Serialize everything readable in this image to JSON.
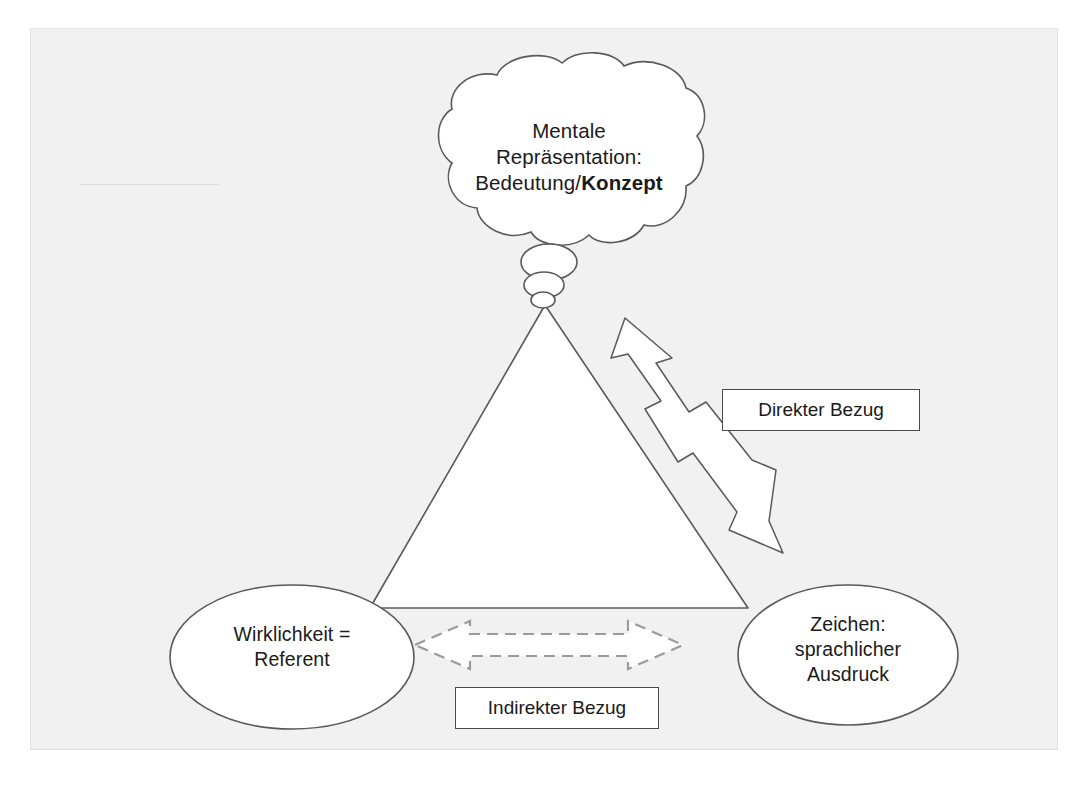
{
  "diagram": {
    "nodes": {
      "cloud": {
        "shape": "thought-cloud",
        "line1": "Mentale",
        "line2": "Repräsentation:",
        "line3_prefix": "Bedeutung/",
        "line3_bold": "Konzept"
      },
      "referent": {
        "shape": "ellipse",
        "line1": "Wirklichkeit =",
        "line2": "Referent"
      },
      "zeichen": {
        "shape": "ellipse",
        "line1": "Zeichen:",
        "line2": "sprachlicher",
        "line3": "Ausdruck"
      }
    },
    "connectors": {
      "direct": {
        "label": "Direkter Bezug",
        "style": "solid-outline-block-arrow",
        "heads": "double",
        "orientation": "diagonal"
      },
      "indirect": {
        "label": "Indirekter Bezug",
        "style": "dashed-outline-block-arrow",
        "heads": "double",
        "orientation": "horizontal"
      }
    },
    "colors": {
      "panel_background": "#f1f1f1",
      "page_background": "#ffffff",
      "stroke": "#5a5a5a",
      "text": "#1a1a1a",
      "box_border": "#4a4a4a",
      "dashed_arrow_stroke": "#9a9a9a",
      "shape_fill": "#ffffff"
    }
  }
}
